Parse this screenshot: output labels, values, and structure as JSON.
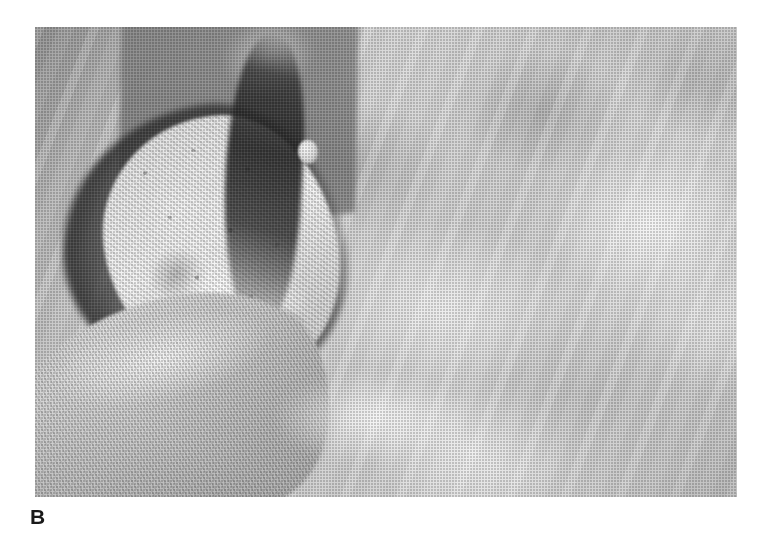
{
  "figure": {
    "panel_label": "B",
    "panel_above_label": "A",
    "image_type": "halftone-printed grayscale gross pathology photograph",
    "alt_description": "Cut section of an excised specimen showing a pale nodular lesion mass at the left with a dark fissure along its right border, bounded below by a striated tissue lip, against a mottled light-grey tissue field.",
    "photo": {
      "x": 35,
      "y": 27,
      "width": 702,
      "height": 470
    },
    "regions": [
      {
        "name": "tissue-field",
        "label": "mottled light-grey tissue background"
      },
      {
        "name": "upper-band",
        "label": "darker grey vertical band from upper margin"
      },
      {
        "name": "lesion-mass",
        "label": "pale nodular tumour mass"
      },
      {
        "name": "lesion-rim",
        "label": "dark rim bounding the lesion"
      },
      {
        "name": "fissure",
        "label": "dark crevice along right border of lesion"
      },
      {
        "name": "lower-lip",
        "label": "striated tissue lip at lower left"
      },
      {
        "name": "bottom-highlight",
        "label": "bright highlight pool at lower centre"
      }
    ],
    "colors": {
      "page_background": "#ffffff",
      "label_color": "#1a1a1a",
      "photo_base": "#b9b9b9",
      "tissue_light": "#d6d6d6",
      "tissue_mid": "#9a9a9a",
      "lesion_highlight": "#f2f2f2",
      "fissure_dark": "#232323"
    }
  }
}
